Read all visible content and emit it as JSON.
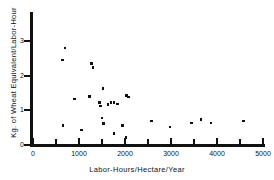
{
  "chart_data": {
    "type": "scatter",
    "title": "",
    "xlabel": "Labor-Hours/Hectare/Year",
    "ylabel": "Kg. of Wheat Equivalent/Labor-Hour",
    "xlim": [
      0,
      5000
    ],
    "ylim": [
      0,
      3.6
    ],
    "grid": false,
    "legend": null,
    "x_ticks": [
      0,
      1000,
      2000,
      3000,
      4000,
      5000
    ],
    "x_tick_labels": [
      "0",
      "1000",
      "2000",
      "3000",
      "4000",
      "5000"
    ],
    "x_minor_ticks": [
      500,
      1500,
      2500,
      3500,
      4500
    ],
    "y_ticks": [
      0,
      1,
      2,
      3
    ],
    "y_tick_labels": [
      "0",
      "1",
      "2",
      "3"
    ],
    "marker": "square",
    "marker_color": "#111111",
    "points": [
      {
        "x": 700,
        "y": 2.8
      },
      {
        "x": 640,
        "y": 2.45
      },
      {
        "x": 1270,
        "y": 2.35
      },
      {
        "x": 1300,
        "y": 2.23
      },
      {
        "x": 1520,
        "y": 1.63
      },
      {
        "x": 2030,
        "y": 1.43
      },
      {
        "x": 2070,
        "y": 1.38
      },
      {
        "x": 1230,
        "y": 1.4
      },
      {
        "x": 900,
        "y": 1.33
      },
      {
        "x": 1450,
        "y": 1.22
      },
      {
        "x": 1700,
        "y": 1.22
      },
      {
        "x": 1760,
        "y": 1.23
      },
      {
        "x": 1470,
        "y": 1.13
      },
      {
        "x": 1630,
        "y": 1.17
      },
      {
        "x": 1840,
        "y": 1.18
      },
      {
        "x": 1500,
        "y": 0.78
      },
      {
        "x": 1530,
        "y": 0.62
      },
      {
        "x": 650,
        "y": 0.57
      },
      {
        "x": 1950,
        "y": 0.56
      },
      {
        "x": 2580,
        "y": 0.69
      },
      {
        "x": 2980,
        "y": 0.52
      },
      {
        "x": 3450,
        "y": 0.64
      },
      {
        "x": 3650,
        "y": 0.73
      },
      {
        "x": 3870,
        "y": 0.63
      },
      {
        "x": 4580,
        "y": 0.69
      },
      {
        "x": 1050,
        "y": 0.43
      },
      {
        "x": 1760,
        "y": 0.33
      },
      {
        "x": 2020,
        "y": 0.22
      }
    ]
  }
}
